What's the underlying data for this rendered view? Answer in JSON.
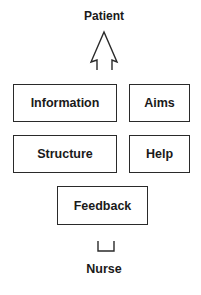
{
  "diagram": {
    "top_label": "Patient",
    "bottom_label": "Nurse",
    "boxes": [
      {
        "id": "information",
        "label": "Information"
      },
      {
        "id": "aims",
        "label": "Aims"
      },
      {
        "id": "structure",
        "label": "Structure"
      },
      {
        "id": "help",
        "label": "Help"
      },
      {
        "id": "feedback",
        "label": "Feedback"
      }
    ],
    "connectors": [
      {
        "type": "open-arrow-up",
        "points_to": "Patient"
      },
      {
        "type": "cup-bracket",
        "from": "Nurse"
      }
    ],
    "colors": {
      "stroke": "#2a2a2a",
      "text": "#1a1a1a",
      "background": "#ffffff"
    }
  }
}
